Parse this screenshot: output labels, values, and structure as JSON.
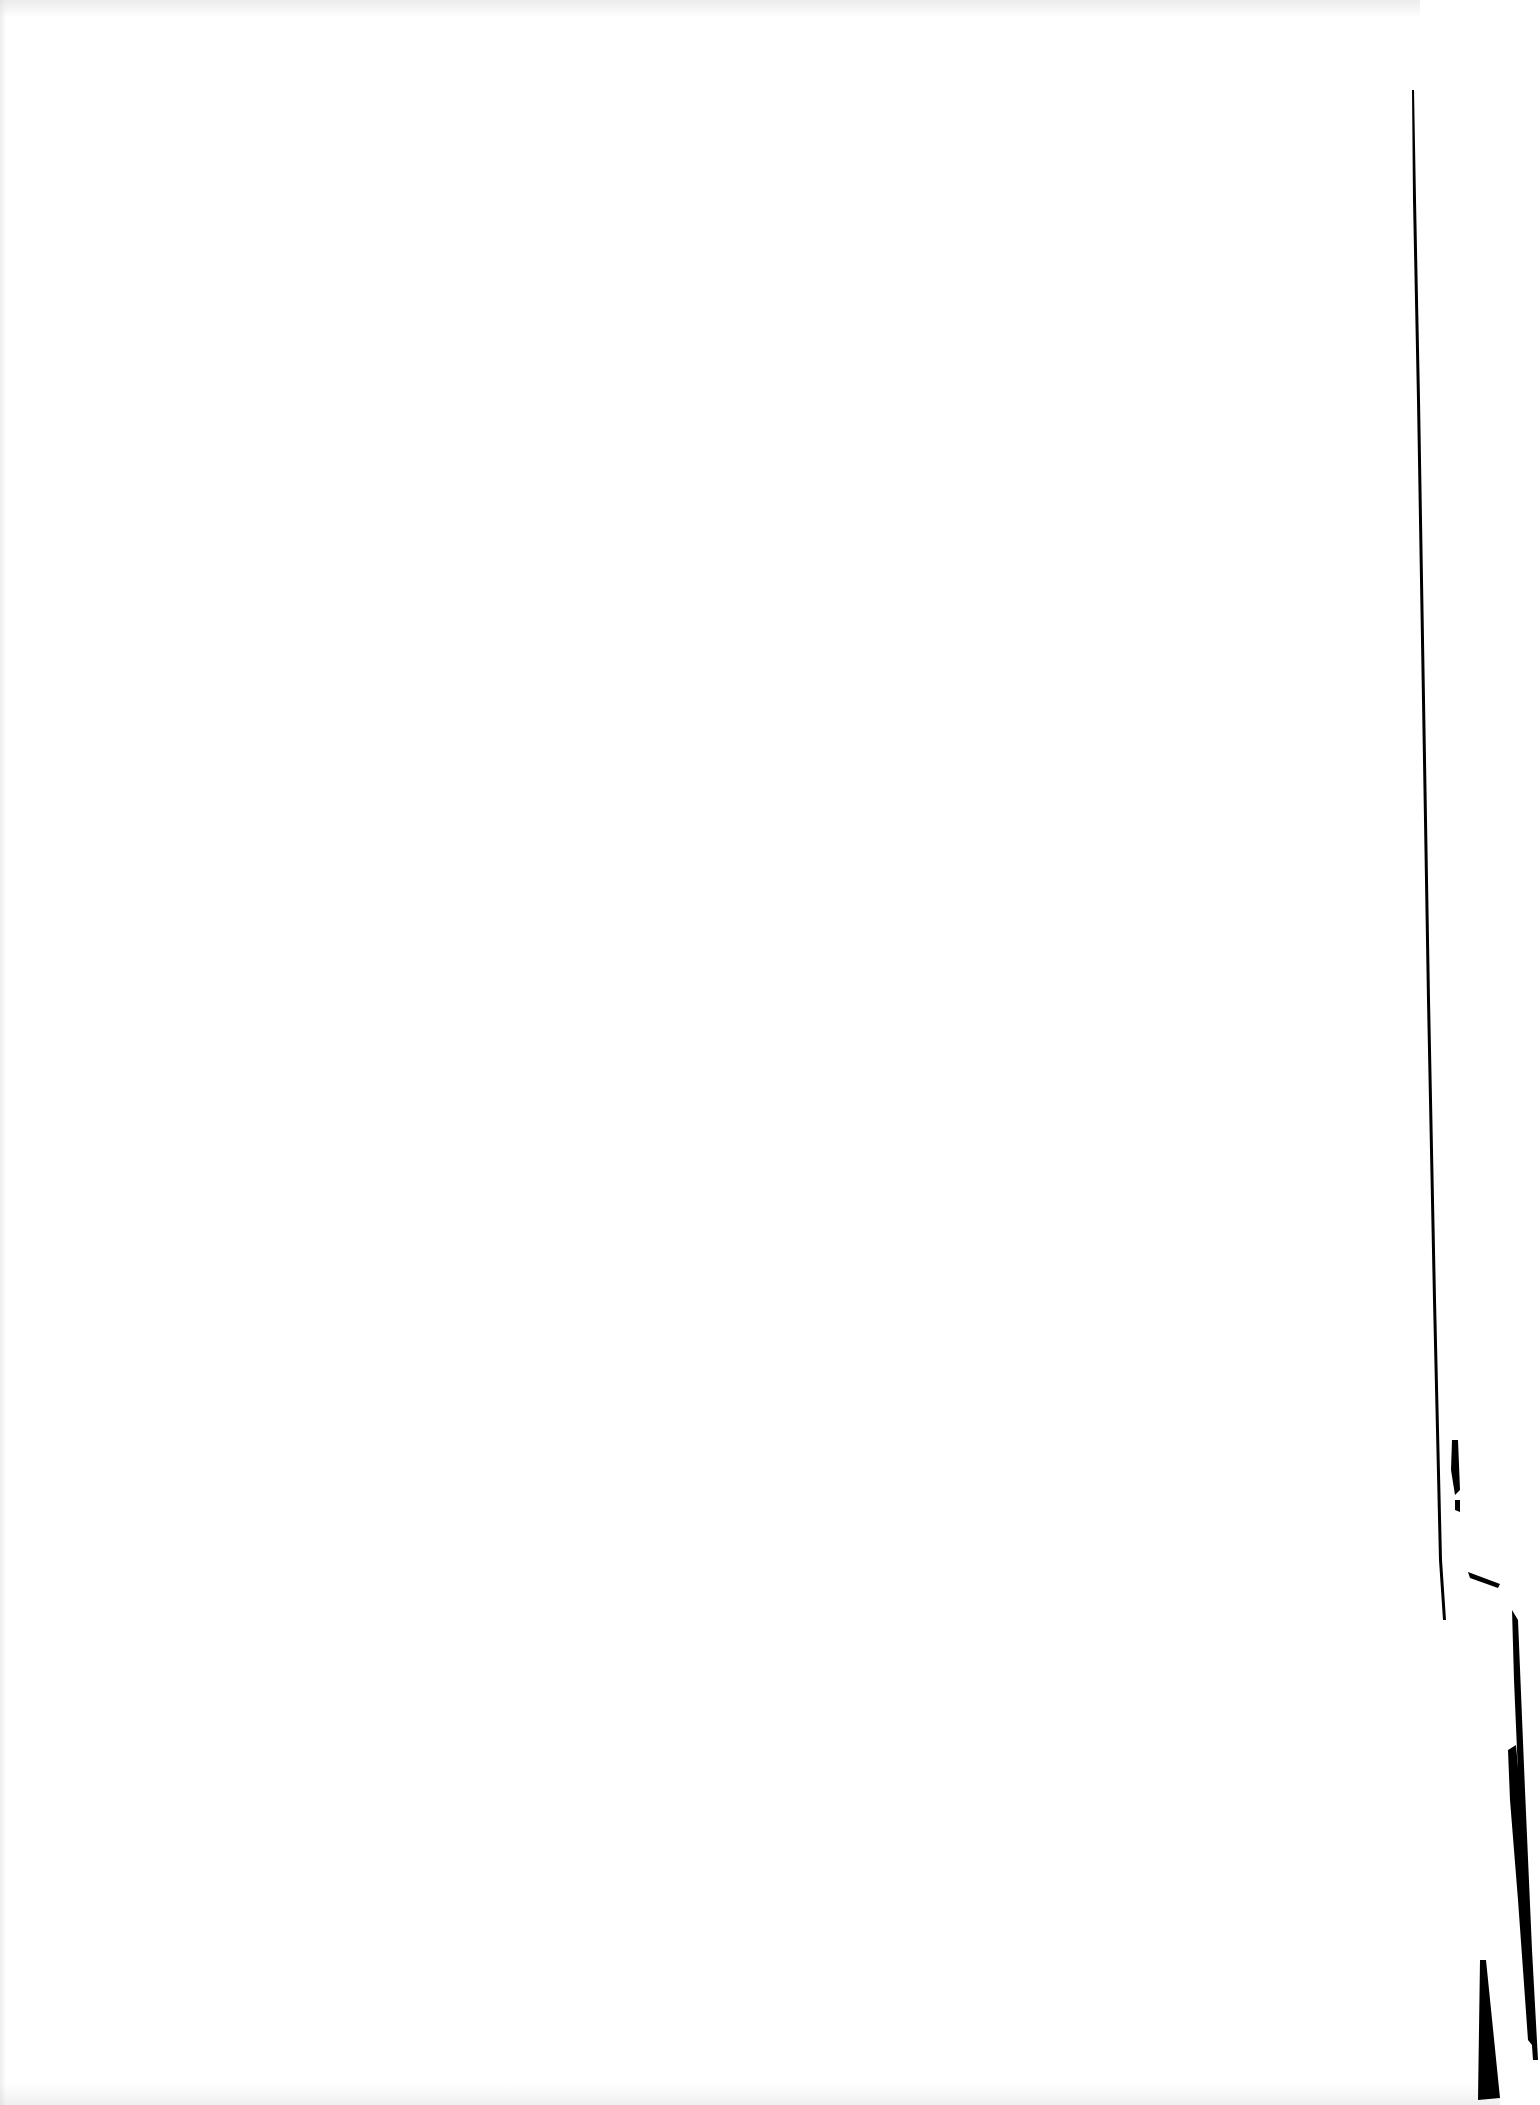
{
  "page": {
    "content": "",
    "background_color": "#ffffff",
    "edge_color": "#000000"
  }
}
